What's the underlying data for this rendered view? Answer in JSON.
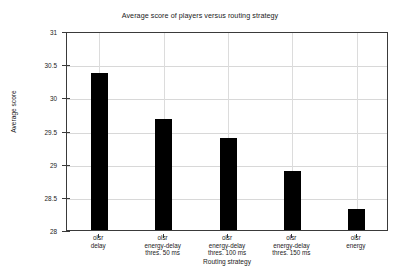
{
  "chart_data": {
    "type": "bar",
    "title": "Average score of players versus routing strategy",
    "xlabel": "Routing strategy",
    "ylabel": "Average score",
    "categories": [
      "olsr\ndelay",
      "olsr\nenergy-delay\nthres. 50 ms",
      "olsr\nenergy-delay\nthres. 100 ms",
      "olsr\nenergy-delay\nthres. 150 ms",
      "olsr\nenergy"
    ],
    "category_lines": [
      [
        "olsr",
        "delay"
      ],
      [
        "olsr",
        "energy-delay",
        "thres. 50 ms"
      ],
      [
        "olsr",
        "energy-delay",
        "thres. 100 ms"
      ],
      [
        "olsr",
        "energy-delay",
        "thres. 150 ms"
      ],
      [
        "olsr",
        "energy"
      ]
    ],
    "values": [
      30.4,
      29.7,
      29.41,
      28.92,
      28.34
    ],
    "ylim": [
      28,
      31
    ],
    "yticks": [
      28,
      28.5,
      29,
      29.5,
      30,
      30.5,
      31
    ],
    "ytick_labels": [
      "28",
      "28.5",
      "29",
      "29.5",
      "30",
      "30.5",
      "31"
    ],
    "grid": true,
    "legend": null,
    "bar_color": "#000000",
    "grid_color": "#d8d8d8",
    "axis_color": "#3a3a3a",
    "background_color": "#ffffff"
  }
}
